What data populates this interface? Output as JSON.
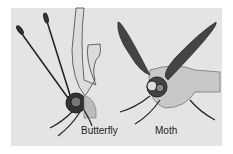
{
  "labels": {
    "butterfly": "Butterfly",
    "moth": "Moth"
  },
  "colors": {
    "background": "#e4e4e4",
    "ink": "#1e1e1e"
  }
}
